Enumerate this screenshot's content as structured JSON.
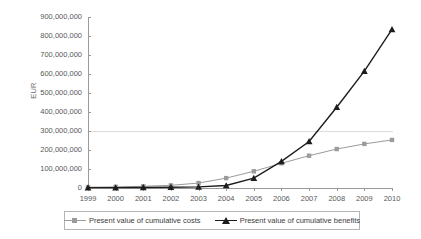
{
  "chart_data": {
    "type": "line",
    "title": "",
    "xlabel": "",
    "ylabel": "EUR",
    "ylim": [
      0,
      900000000
    ],
    "ytick_step": 100000000,
    "grid": "single horizontal gridline at 300,000,000",
    "legend_position": "bottom",
    "x": [
      1999,
      2000,
      2001,
      2002,
      2003,
      2004,
      2005,
      2006,
      2007,
      2008,
      2009,
      2010
    ],
    "xticklabels": [
      "1999",
      "2000",
      "2001",
      "2002",
      "2003",
      "2004",
      "2005",
      "2006",
      "2007",
      "2008",
      "2009",
      "2010"
    ],
    "yticklabels": [
      "900,000,000",
      "800,000,000",
      "700,000,000",
      "600,000,000",
      "500,000,000",
      "400,000,000",
      "300,000,000",
      "200,000,000",
      "100,000,000",
      "0"
    ],
    "ytickvalues": [
      900000000,
      800000000,
      700000000,
      600000000,
      500000000,
      400000000,
      300000000,
      200000000,
      100000000,
      0
    ],
    "series": [
      {
        "name": "Present value of cumulative costs",
        "marker": "square",
        "color": "#9b9b9b",
        "values": [
          4000000,
          6000000,
          9000000,
          14000000,
          26000000,
          52000000,
          88000000,
          130000000,
          170000000,
          205000000,
          232000000,
          253000000
        ]
      },
      {
        "name": "Present value of cumulative benefits",
        "marker": "triangle",
        "color": "#1d1d1d",
        "values": [
          2000000,
          2000000,
          3000000,
          4000000,
          6000000,
          13000000,
          52000000,
          140000000,
          245000000,
          425000000,
          615000000,
          835000000
        ]
      }
    ]
  },
  "axis": {
    "y_title": "EUR"
  },
  "legend": {
    "entries": [
      {
        "label": "Present value of cumulative costs"
      },
      {
        "label": "Present value of cumulative benefits"
      }
    ]
  }
}
